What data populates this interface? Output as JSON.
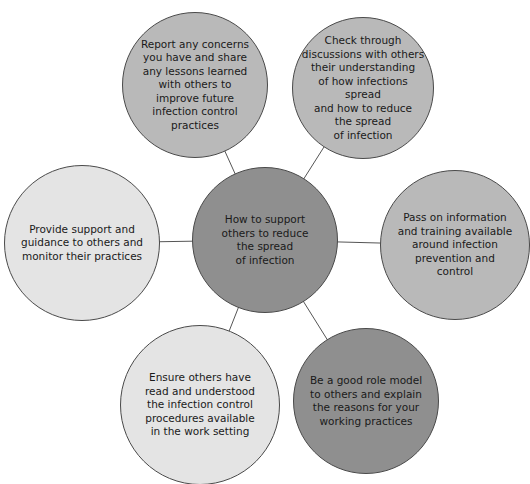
{
  "diagram": {
    "type": "mind-map",
    "center": {
      "text": "How to support\nothers to reduce\nthe spread\nof infection",
      "color": "#8f8f8f"
    },
    "nodes": [
      {
        "id": "top-left",
        "text": "Report any concerns\nyou have and share\nany lessons learned\nwith others to\nimprove future\ninfection control\npractices",
        "color": "#b9b9b9"
      },
      {
        "id": "top-right",
        "text": "Check through\ndiscussions with others\ntheir understanding\nof how infections spread\nand how to reduce\nthe spread\nof infection",
        "color": "#b9b9b9"
      },
      {
        "id": "left",
        "text": "Provide support and\nguidance to others and\nmonitor their practices",
        "color": "#e4e4e4"
      },
      {
        "id": "right",
        "text": "Pass on information\nand training available\naround infection\nprevention and\ncontrol",
        "color": "#b9b9b9"
      },
      {
        "id": "bottom-left",
        "text": "Ensure others have\nread and understood\nthe infection control\nprocedures available\nin the work setting",
        "color": "#b9b9b9"
      },
      {
        "id": "bottom-right",
        "text": "Be a good role model\nto others and explain\nthe reasons for your\nworking practices",
        "color": "#8f8f8f"
      }
    ]
  }
}
